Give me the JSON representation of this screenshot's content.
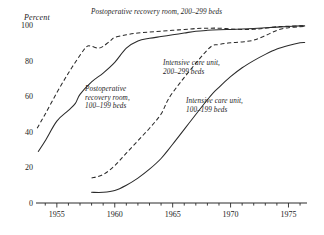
{
  "chart_data": {
    "type": "line",
    "title": "",
    "xlabel": "",
    "ylabel": "Percent",
    "ylim": [
      0,
      100
    ],
    "xlim": [
      1953.2,
      1976.6
    ],
    "yticks": [
      0,
      20,
      40,
      60,
      80,
      100
    ],
    "ytick_labels": [
      "0",
      "20",
      "40",
      "60",
      "80",
      "100"
    ],
    "xticks": [
      1955,
      1960,
      1965,
      1970,
      1975
    ],
    "xtick_labels": [
      "1955",
      "1960",
      "1965",
      "1970",
      "1975"
    ],
    "minor_xticks_every": 1,
    "grid": false,
    "legend_position": "inline-annotations",
    "series": [
      {
        "name": "Postoperative recovery room, 200-299 beds",
        "style": "dashed",
        "x": [
          1953.3,
          1954,
          1955,
          1956,
          1957,
          1957.6,
          1958,
          1958.6,
          1959,
          1959.6,
          1960,
          1961,
          1962,
          1963,
          1964,
          1965,
          1966,
          1967,
          1968,
          1969,
          1970,
          1971,
          1972,
          1973,
          1974,
          1975,
          1976,
          1976.4
        ],
        "values": [
          42,
          50,
          62,
          73,
          83,
          88,
          88,
          87,
          88,
          91,
          93,
          94.5,
          95.5,
          96,
          96.5,
          97,
          97.5,
          98,
          98.2,
          98.2,
          97.8,
          97.5,
          97.6,
          98.2,
          99,
          99.3,
          99.5,
          99.5
        ]
      },
      {
        "name": "Postoperative recovery room, 100-199 beds",
        "style": "solid",
        "x": [
          1953.4,
          1954,
          1955,
          1956,
          1956.6,
          1957,
          1958,
          1959,
          1960,
          1961,
          1962,
          1963,
          1964,
          1965,
          1966,
          1967,
          1968,
          1969,
          1970,
          1971,
          1972,
          1973,
          1974,
          1975,
          1976,
          1976.4
        ],
        "values": [
          29,
          35,
          46,
          52,
          56,
          61,
          68,
          73,
          79,
          87,
          91,
          92.5,
          93.5,
          94.5,
          95.5,
          96.5,
          97,
          97.3,
          97.5,
          97.7,
          98,
          98.4,
          98.8,
          99.2,
          99.5,
          99.5
        ]
      },
      {
        "name": "Intensive care unit, 200-299 beds",
        "style": "dashed",
        "x": [
          1958,
          1959,
          1960,
          1961,
          1962,
          1963,
          1964,
          1965,
          1968,
          1969,
          1970,
          1971,
          1972,
          1973,
          1974,
          1975,
          1976,
          1976.4
        ],
        "values": [
          14,
          16,
          21,
          28,
          35,
          42,
          50,
          62,
          86,
          89,
          90,
          90.5,
          91.5,
          94,
          97,
          98.5,
          99,
          99.2
        ]
      },
      {
        "name": "Intensive care unit, 100-199 beds",
        "style": "solid",
        "x": [
          1958,
          1959,
          1960,
          1961,
          1962,
          1963,
          1964,
          1965,
          1968,
          1969,
          1970,
          1971,
          1972,
          1973,
          1974,
          1975,
          1976,
          1976.4
        ],
        "values": [
          6,
          6,
          7,
          10,
          14,
          19,
          25,
          33,
          58,
          65,
          71,
          76,
          80,
          83.5,
          86.5,
          88.5,
          90,
          90.2
        ]
      }
    ],
    "annotations": [
      {
        "id": "annot-prr-200",
        "lines": [
          "Postoperative recovery room, 200–299 beds"
        ],
        "x": 91,
        "y": 14,
        "anchor": "start"
      },
      {
        "id": "annot-prr-100",
        "lines": [
          "Postoperative",
          "recovery room,",
          "100–199 beds"
        ],
        "x": 85,
        "y": 91,
        "anchor": "start"
      },
      {
        "id": "annot-icu-200",
        "lines": [
          "Intensive care unit,",
          "200–299 beds"
        ],
        "x": 163,
        "y": 65,
        "anchor": "start"
      },
      {
        "id": "annot-icu-100",
        "lines": [
          "Intensive care unit,",
          "100–199 beds"
        ],
        "x": 186,
        "y": 103,
        "anchor": "start"
      }
    ]
  }
}
